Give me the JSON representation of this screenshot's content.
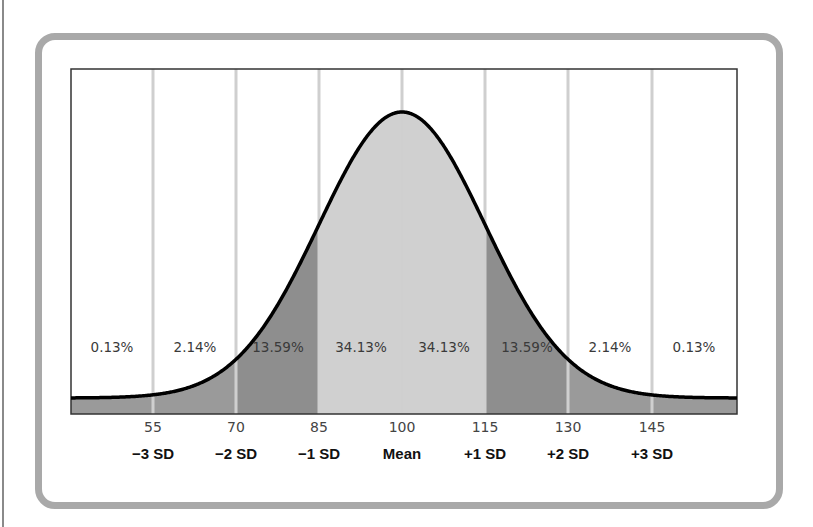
{
  "chart_data": {
    "type": "area",
    "title": "",
    "subtitle": "",
    "xlabel": "",
    "ylabel": "",
    "mean": 100,
    "sd": 15,
    "x_ticks": [
      55,
      70,
      85,
      100,
      115,
      130,
      145
    ],
    "sd_labels": [
      "−3 SD",
      "−2 SD",
      "−1 SD",
      "Mean",
      "+1 SD",
      "+2 SD",
      "+3 SD"
    ],
    "bands": [
      {
        "range": [
          null,
          55
        ],
        "percent": "0.13%",
        "fill": "#9a9a9a"
      },
      {
        "range": [
          55,
          70
        ],
        "percent": "2.14%",
        "fill": "#9a9a9a"
      },
      {
        "range": [
          70,
          85
        ],
        "percent": "13.59%",
        "fill": "#8e8e8e"
      },
      {
        "range": [
          85,
          100
        ],
        "percent": "34.13%",
        "fill": "#d0d0d0"
      },
      {
        "range": [
          100,
          115
        ],
        "percent": "34.13%",
        "fill": "#d0d0d0"
      },
      {
        "range": [
          115,
          130
        ],
        "percent": "13.59%",
        "fill": "#8e8e8e"
      },
      {
        "range": [
          130,
          145
        ],
        "percent": "2.14%",
        "fill": "#9a9a9a"
      },
      {
        "range": [
          145,
          null
        ],
        "percent": "0.13%",
        "fill": "#9a9a9a"
      }
    ],
    "grid": true,
    "gridlines_at": [
      55,
      70,
      85,
      100,
      115,
      130,
      145
    ],
    "legend": null
  },
  "labels": {
    "percents": [
      "0.13%",
      "2.14%",
      "13.59%",
      "34.13%",
      "34.13%",
      "13.59%",
      "2.14%",
      "0.13%"
    ],
    "ticks": [
      "55",
      "70",
      "85",
      "100",
      "115",
      "130",
      "145"
    ],
    "sd": [
      "−3 SD",
      "−2 SD",
      "−1 SD",
      "Mean",
      "+1 SD",
      "+2 SD",
      "+3 SD"
    ]
  },
  "colors": {
    "frame": "#a9a9a9",
    "curve": "#000000",
    "gridline": "#c8c8c8",
    "center_band": "#d0d0d0",
    "one_to_two_sd_band": "#8e8e8e",
    "tail_band": "#9a9a9a"
  }
}
